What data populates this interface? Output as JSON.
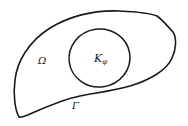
{
  "diagram": {
    "stroke_color": "#1a1a1a",
    "background_color": "#ffffff",
    "regions": [
      {
        "id": "outer",
        "label": "Ω",
        "role": "domain"
      },
      {
        "id": "inner",
        "label_main": "K",
        "label_sub": "φ",
        "role": "subregion"
      }
    ],
    "boundary": {
      "label": "Γ"
    }
  }
}
